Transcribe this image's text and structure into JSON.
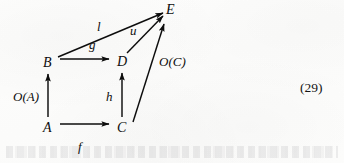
{
  "figure": {
    "kind": "commutative-diagram",
    "equation_number": "(29)",
    "ink_color": "#0d0d0d",
    "background_color": "#fdfdfc",
    "nodes": [
      {
        "id": "A",
        "label": "A",
        "x": 48,
        "y": 128
      },
      {
        "id": "B",
        "label": "B",
        "x": 48,
        "y": 63
      },
      {
        "id": "C",
        "label": "C",
        "x": 122,
        "y": 128
      },
      {
        "id": "D",
        "label": "D",
        "x": 122,
        "y": 62
      },
      {
        "id": "E",
        "label": "E",
        "x": 170,
        "y": 10
      }
    ],
    "edges": [
      {
        "id": "A-C",
        "from": "A",
        "to": "C",
        "label": "f",
        "label_x": 80,
        "label_y": 148
      },
      {
        "id": "A-B",
        "from": "A",
        "to": "B",
        "label": "O(A)",
        "label_x": 14,
        "label_y": 97
      },
      {
        "id": "B-D",
        "from": "B",
        "to": "D",
        "label": "g",
        "label_x": 90,
        "label_y": 45
      },
      {
        "id": "C-D",
        "from": "C",
        "to": "D",
        "label": "h",
        "label_x": 107,
        "label_y": 97
      },
      {
        "id": "B-E",
        "from": "B",
        "to": "E",
        "label": "l",
        "label_x": 98,
        "label_y": 27
      },
      {
        "id": "D-E",
        "from": "D",
        "to": "E",
        "label": "u",
        "label_x": 131,
        "label_y": 31
      },
      {
        "id": "C-E",
        "from": "C",
        "to": "E",
        "label": "O(C)",
        "label_x": 160,
        "label_y": 62
      }
    ]
  }
}
